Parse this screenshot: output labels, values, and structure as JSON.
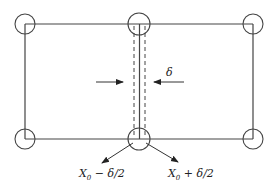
{
  "diagram": {
    "type": "grid-cell with interface strip",
    "labels": {
      "delta": "δ",
      "left_position": {
        "base": "X",
        "sub": "0",
        "rest": " − δ/2"
      },
      "right_position": {
        "base": "X",
        "sub": "0",
        "rest": " + δ/2"
      }
    },
    "nodes": [
      {
        "id": "top-left",
        "x": 25,
        "y": 24
      },
      {
        "id": "top-center",
        "x": 139,
        "y": 24
      },
      {
        "id": "top-right",
        "x": 253,
        "y": 24
      },
      {
        "id": "bottom-left",
        "x": 25,
        "y": 139
      },
      {
        "id": "bottom-center",
        "x": 139,
        "y": 139
      },
      {
        "id": "bottom-right",
        "x": 253,
        "y": 139
      }
    ],
    "colors": {
      "stroke": "#333333",
      "background": "#ffffff"
    }
  }
}
